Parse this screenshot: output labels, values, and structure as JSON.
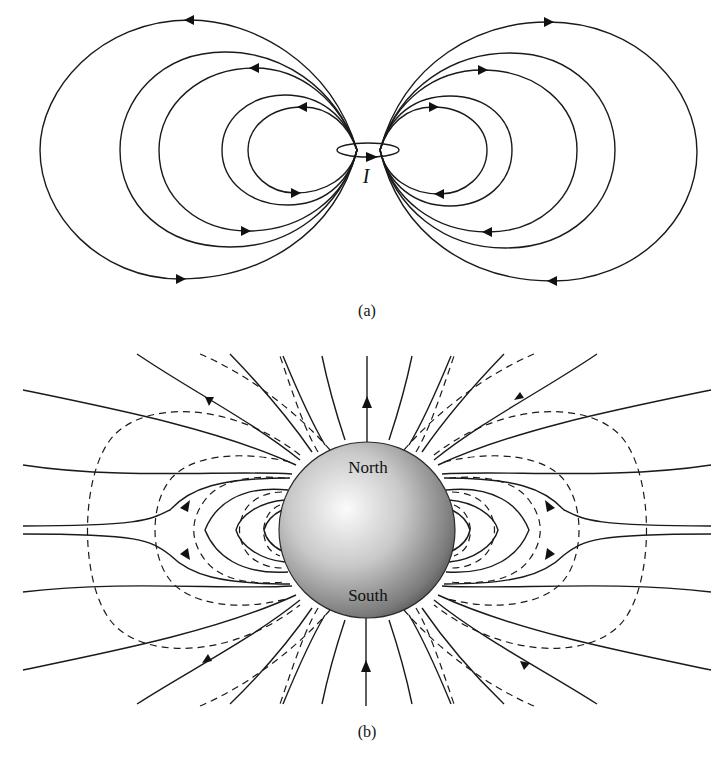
{
  "figure": {
    "panel_a": {
      "caption": "(a)",
      "current_label": "I",
      "description": "Magnetic field lines of a current loop"
    },
    "panel_b": {
      "caption": "(b)",
      "north_label": "North",
      "south_label": "South",
      "description": "Earth's dipole field lines (solid) and dipole approximation (dashed)"
    }
  },
  "colors": {
    "line": "#1a1a1a",
    "background": "#ffffff",
    "sphere_light": "#f4f4f4",
    "sphere_dark": "#4a4a4a"
  }
}
